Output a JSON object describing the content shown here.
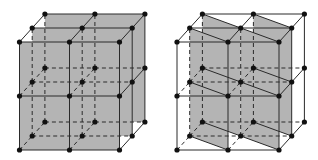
{
  "colors": {
    "background": "#ffffff",
    "plane_fill": "#b4b4b4",
    "line": "#2a2a2a",
    "node": "#111111"
  },
  "figures": [
    {
      "name": "left-lattice",
      "description": "Three planes parallel to the front face shaded",
      "origin": [
        19.5,
        150
      ],
      "step_x": 50,
      "step_y": 54,
      "depth_dx": 12.7,
      "depth_dy": -14,
      "planes": [
        [
          [
            0,
            0,
            2
          ],
          [
            2,
            0,
            2
          ],
          [
            2,
            2,
            2
          ],
          [
            0,
            2,
            2
          ]
        ],
        [
          [
            0,
            0,
            1
          ],
          [
            2,
            0,
            1
          ],
          [
            2,
            2,
            1
          ],
          [
            0,
            2,
            1
          ]
        ],
        [
          [
            0,
            0,
            0
          ],
          [
            2,
            0,
            0
          ],
          [
            2,
            2,
            0
          ],
          [
            0,
            2,
            0
          ]
        ]
      ],
      "extra_lines": []
    },
    {
      "name": "right-lattice",
      "description": "Two pairs of diagonal vertical planes shaded",
      "origin": [
        177,
        150
      ],
      "step_x": 51,
      "step_y": 54,
      "depth_dx": 12.7,
      "depth_dy": -14,
      "planes": [
        [
          [
            0,
            0,
            2
          ],
          [
            1,
            0,
            1
          ],
          [
            1,
            2,
            1
          ],
          [
            0,
            2,
            2
          ]
        ],
        [
          [
            0,
            0,
            1
          ],
          [
            1,
            0,
            0
          ],
          [
            1,
            2,
            0
          ],
          [
            0,
            2,
            1
          ]
        ],
        [
          [
            1,
            0,
            2
          ],
          [
            2,
            0,
            1
          ],
          [
            2,
            2,
            1
          ],
          [
            1,
            2,
            2
          ]
        ],
        [
          [
            1,
            0,
            1
          ],
          [
            2,
            0,
            0
          ],
          [
            2,
            2,
            0
          ],
          [
            1,
            2,
            1
          ]
        ]
      ],
      "extra_lines": [
        [
          [
            0,
            2,
            2
          ],
          [
            1,
            2,
            1
          ]
        ],
        [
          [
            0,
            2,
            1
          ],
          [
            1,
            2,
            0
          ]
        ],
        [
          [
            0,
            1,
            2
          ],
          [
            1,
            1,
            1
          ]
        ],
        [
          [
            0,
            1,
            1
          ],
          [
            1,
            1,
            0
          ]
        ],
        [
          [
            0,
            0,
            2
          ],
          [
            1,
            0,
            1
          ]
        ],
        [
          [
            0,
            0,
            1
          ],
          [
            1,
            0,
            0
          ]
        ],
        [
          [
            1,
            2,
            2
          ],
          [
            2,
            2,
            1
          ]
        ],
        [
          [
            1,
            2,
            1
          ],
          [
            2,
            2,
            0
          ]
        ],
        [
          [
            1,
            1,
            2
          ],
          [
            2,
            1,
            1
          ]
        ],
        [
          [
            1,
            1,
            1
          ],
          [
            2,
            1,
            0
          ]
        ],
        [
          [
            1,
            0,
            2
          ],
          [
            2,
            0,
            1
          ]
        ],
        [
          [
            1,
            0,
            1
          ],
          [
            2,
            0,
            0
          ]
        ]
      ]
    }
  ]
}
